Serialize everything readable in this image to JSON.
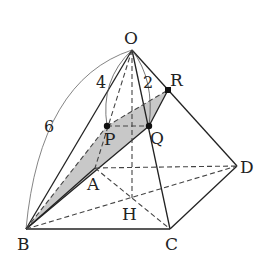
{
  "diagram": {
    "points": {
      "O": {
        "label": "O",
        "x": 132,
        "y": 50
      },
      "A": {
        "label": "A",
        "x": 95,
        "y": 168
      },
      "B": {
        "label": "B",
        "x": 26,
        "y": 229
      },
      "C": {
        "label": "C",
        "x": 170,
        "y": 229
      },
      "D": {
        "label": "D",
        "x": 237,
        "y": 166
      },
      "H": {
        "label": "H",
        "x": 132,
        "y": 198
      },
      "P": {
        "label": "P",
        "x": 107,
        "y": 126
      },
      "Q": {
        "label": "Q",
        "x": 149,
        "y": 126
      },
      "R": {
        "label": "R",
        "x": 168,
        "y": 90
      }
    },
    "measures": {
      "OB": "6",
      "OP": "4",
      "OQ": "2"
    },
    "colors": {
      "stroke": "#222222",
      "shade": "#c8c8c8",
      "arc": "#666666"
    }
  }
}
